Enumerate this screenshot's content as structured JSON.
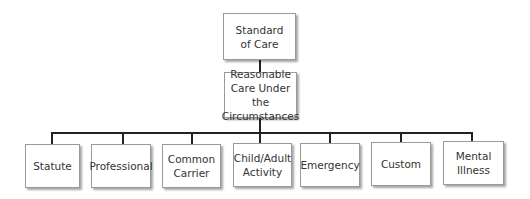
{
  "diagram": {
    "root": {
      "label": "Standard\nof Care"
    },
    "middle": {
      "label": "Reasonable\nCare Under the\nCircumstances"
    },
    "children": [
      {
        "label": "Statute"
      },
      {
        "label": "Professional"
      },
      {
        "label": "Common\nCarrier"
      },
      {
        "label": "Child/Adult\nActivity"
      },
      {
        "label": "Emergency"
      },
      {
        "label": "Custom"
      },
      {
        "label": "Mental\nIllness"
      }
    ]
  }
}
